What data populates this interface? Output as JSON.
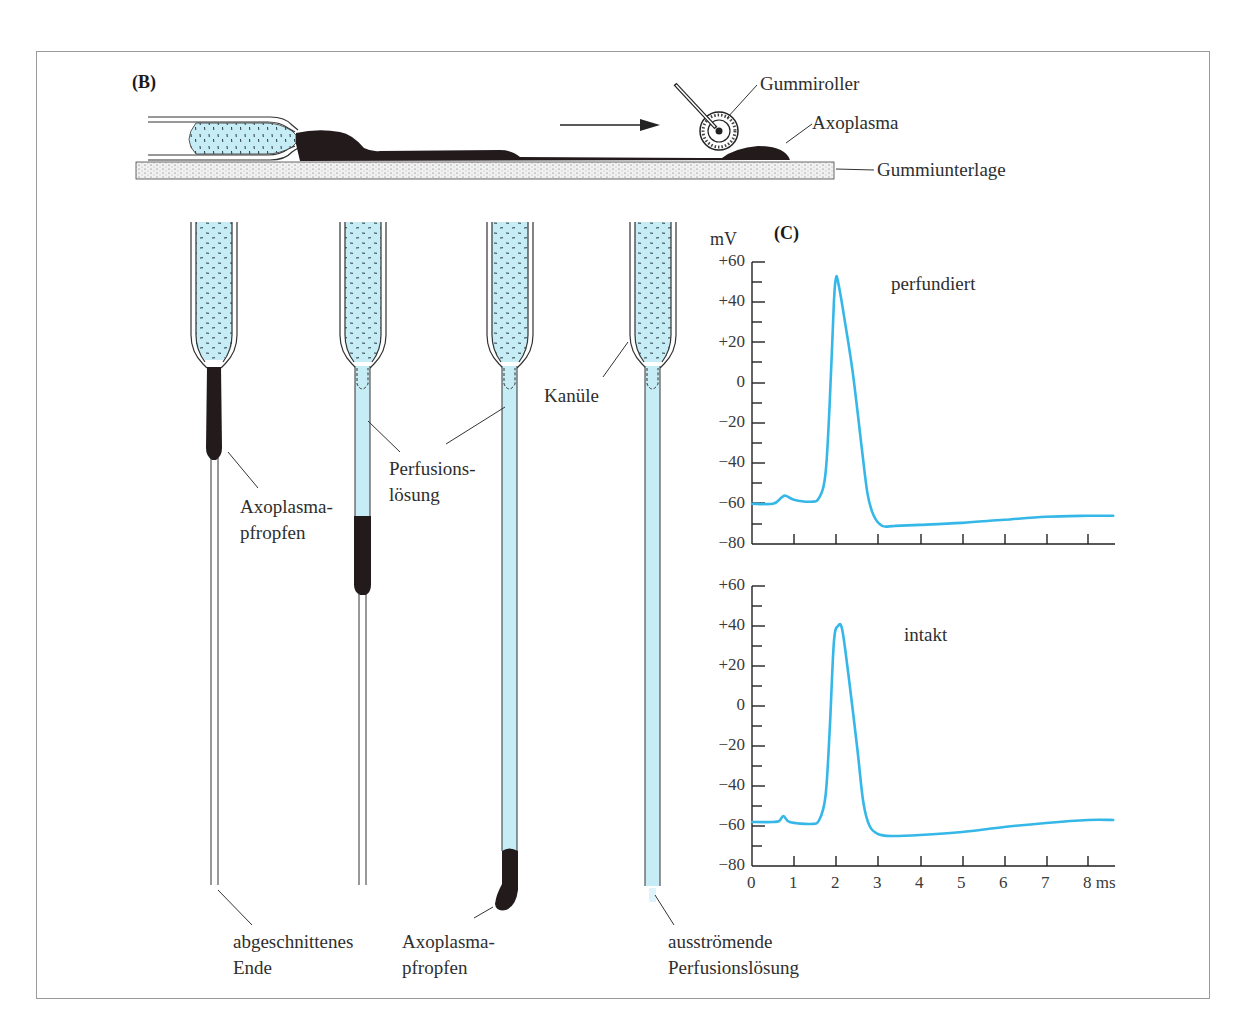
{
  "panels": {
    "B": {
      "label": "(B)"
    },
    "C": {
      "label": "(C)"
    }
  },
  "roller_diagram": {
    "labels": {
      "roller": "Gummiroller",
      "axoplasm": "Axoplasma",
      "base": "Gummiunterlage"
    },
    "arrow_direction": "right"
  },
  "cannula_stages": {
    "labels": {
      "plug_1_line1": "Axoplasma-",
      "plug_1_line2": "pfropfen",
      "perfusion_line1": "Perfusions-",
      "perfusion_line2": "lösung",
      "cannula": "Kanüle",
      "cut_end_line1": "abgeschnittenes",
      "cut_end_line2": "Ende",
      "plug_2_line1": "Axoplasma-",
      "plug_2_line2": "pfropfen",
      "outflow_line1": "ausströmende",
      "outflow_line2": "Perfusionslösung"
    }
  },
  "colors": {
    "perfusion_fluid": "#c6ecf5",
    "axoplasm": "#231a1c",
    "trace": "#35b7e8",
    "frame": "#9a9a9a"
  },
  "chart_data": [
    {
      "type": "line",
      "title": "perfundiert",
      "xlabel": "ms",
      "ylabel": "mV",
      "xlim": [
        0,
        8.6
      ],
      "ylim": [
        -80,
        60
      ],
      "yticks": [
        "+60",
        "+40",
        "+20",
        "0",
        "−20",
        "−40",
        "−60",
        "−80"
      ],
      "xticks": [
        "0",
        "1",
        "2",
        "3",
        "4",
        "5",
        "6",
        "7",
        "8 ms"
      ],
      "grid": false,
      "series": [
        {
          "name": "perfundiert",
          "x": [
            0,
            0.5,
            0.7,
            0.8,
            1.0,
            1.4,
            1.6,
            1.75,
            1.85,
            1.95,
            2.0,
            2.05,
            2.2,
            2.4,
            2.6,
            2.75,
            2.9,
            3.1,
            3.4,
            4,
            5,
            6,
            7,
            8,
            8.6
          ],
          "values": [
            -60,
            -60,
            -57,
            -56,
            -58,
            -59,
            -57,
            -45,
            -10,
            40,
            52,
            50,
            32,
            5,
            -30,
            -55,
            -66,
            -71,
            -71,
            -70.5,
            -69.5,
            -68,
            -66.5,
            -66,
            -66
          ]
        }
      ]
    },
    {
      "type": "line",
      "title": "intakt",
      "xlabel": "ms",
      "ylabel": "mV",
      "xlim": [
        0,
        8.6
      ],
      "ylim": [
        -80,
        60
      ],
      "yticks": [
        "+60",
        "+40",
        "+20",
        "0",
        "−20",
        "−40",
        "−60",
        "−80"
      ],
      "xticks": [
        "0",
        "1",
        "2",
        "3",
        "4",
        "5",
        "6",
        "7",
        "8 ms"
      ],
      "grid": false,
      "series": [
        {
          "name": "intakt",
          "x": [
            0,
            0.5,
            0.65,
            0.75,
            0.9,
            1.4,
            1.6,
            1.75,
            1.85,
            1.95,
            2.05,
            2.15,
            2.3,
            2.5,
            2.65,
            2.8,
            3.0,
            3.3,
            4,
            5,
            6,
            7,
            8,
            8.6
          ],
          "values": [
            -58,
            -58,
            -57.5,
            -55,
            -58,
            -59,
            -57,
            -45,
            -12,
            32,
            40,
            38,
            15,
            -20,
            -48,
            -60,
            -64,
            -65,
            -64.5,
            -63,
            -60.5,
            -58.5,
            -57,
            -57
          ]
        }
      ]
    }
  ]
}
